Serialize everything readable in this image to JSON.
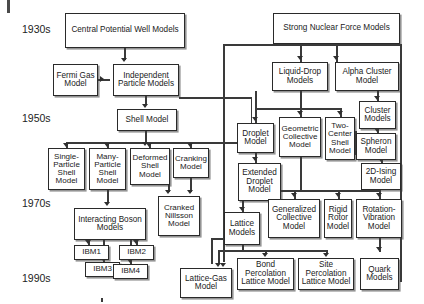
{
  "diagram": {
    "type": "flowchart",
    "eras": [
      {
        "id": "era-1930s",
        "label": "1930s",
        "x": 22,
        "y": 23,
        "size": 10.5
      },
      {
        "id": "era-1950s",
        "label": "1950s",
        "x": 22,
        "y": 112,
        "size": 10.5
      },
      {
        "id": "era-1970s",
        "label": "1970s",
        "x": 22,
        "y": 197,
        "size": 10.5
      },
      {
        "id": "era-1990s",
        "label": "1990s",
        "x": 22,
        "y": 272,
        "size": 10.5
      }
    ],
    "nodes": [
      {
        "id": "central-potential-well-models",
        "label": "Central Potential Well Models",
        "x": 65,
        "y": 13,
        "w": 120,
        "h": 35,
        "size": 8.2
      },
      {
        "id": "fermi-gas-model",
        "label": "Fermi Gas Model",
        "x": 53,
        "y": 64,
        "w": 45,
        "h": 32,
        "size": 8.2
      },
      {
        "id": "independent-particle-models",
        "label": "Independent Particle Models",
        "x": 113,
        "y": 64,
        "w": 66,
        "h": 32,
        "size": 8.2
      },
      {
        "id": "shell-model",
        "label": "Shell Model",
        "x": 117,
        "y": 109,
        "w": 60,
        "h": 22,
        "size": 8.2
      },
      {
        "id": "single-particle-shell-model",
        "label": "Single-Particle Shell Model",
        "x": 48,
        "y": 148,
        "w": 37,
        "h": 42,
        "size": 8.0
      },
      {
        "id": "many-particle-shell-model",
        "label": "Many-Particle Shell Model",
        "x": 89,
        "y": 148,
        "w": 37,
        "h": 42,
        "size": 8.0
      },
      {
        "id": "deformed-shell-model",
        "label": "Deformed Shell Model",
        "x": 130,
        "y": 148,
        "w": 40,
        "h": 37,
        "size": 8.0
      },
      {
        "id": "cranking-model",
        "label": "Cranking Model",
        "x": 173,
        "y": 148,
        "w": 36,
        "h": 30,
        "size": 8.0
      },
      {
        "id": "cranked-nillsson-model",
        "label": "Cranked Nillsson Model",
        "x": 158,
        "y": 196,
        "w": 42,
        "h": 40,
        "size": 8.0
      },
      {
        "id": "interacting-boson-models",
        "label": "Interacting Boson Models",
        "x": 74,
        "y": 208,
        "w": 72,
        "h": 32,
        "size": 8.2
      },
      {
        "id": "ibm1",
        "label": "IBM1",
        "x": 74,
        "y": 245,
        "w": 35,
        "h": 15,
        "size": 8.0
      },
      {
        "id": "ibm2",
        "label": "IBM2",
        "x": 119,
        "y": 245,
        "w": 35,
        "h": 15,
        "size": 8.0
      },
      {
        "id": "ibm3",
        "label": "IBM3",
        "x": 85,
        "y": 262,
        "w": 35,
        "h": 15,
        "size": 8.0
      },
      {
        "id": "ibm4",
        "label": "IBM4",
        "x": 113,
        "y": 264,
        "w": 35,
        "h": 15,
        "size": 8.0
      },
      {
        "id": "lattice-gas-model",
        "label": "Lattice-Gas Model",
        "x": 180,
        "y": 268,
        "w": 52,
        "h": 30,
        "size": 8.2
      },
      {
        "id": "strong-nuclear-force-models",
        "label": "Strong Nuclear Force Models",
        "x": 273,
        "y": 13,
        "w": 127,
        "h": 31,
        "size": 8.2
      },
      {
        "id": "liquid-drop-models",
        "label": "Liquid-Drop Models",
        "x": 272,
        "y": 62,
        "w": 56,
        "h": 29,
        "size": 8.2
      },
      {
        "id": "alpha-cluster-model",
        "label": "Alpha Cluster Model",
        "x": 335,
        "y": 62,
        "w": 64,
        "h": 29,
        "size": 8.2
      },
      {
        "id": "droplet-model",
        "label": "Droplet Model",
        "x": 237,
        "y": 123,
        "w": 37,
        "h": 30,
        "size": 8.2
      },
      {
        "id": "geometric-collective-model",
        "label": "Geometric Collective Model",
        "x": 279,
        "y": 117,
        "w": 42,
        "h": 40,
        "size": 8.0
      },
      {
        "id": "two-center-shell-model",
        "label": "Two-Center Shell Model",
        "x": 325,
        "y": 117,
        "w": 30,
        "h": 43,
        "size": 8.0
      },
      {
        "id": "cluster-models",
        "label": "Cluster Models",
        "x": 359,
        "y": 101,
        "w": 37,
        "h": 28,
        "size": 8.2
      },
      {
        "id": "spheron-model",
        "label": "Spheron Model",
        "x": 356,
        "y": 133,
        "w": 40,
        "h": 27,
        "size": 8.2
      },
      {
        "id": "2d-ising-model",
        "label": "2D-Ising Model",
        "x": 361,
        "y": 163,
        "w": 40,
        "h": 27,
        "size": 8.2
      },
      {
        "id": "extended-droplet-model",
        "label": "Extended Droplet Model",
        "x": 238,
        "y": 163,
        "w": 43,
        "h": 38,
        "size": 8.2
      },
      {
        "id": "lattice-models",
        "label": "Lattice Models",
        "x": 224,
        "y": 212,
        "w": 36,
        "h": 33,
        "size": 8.2
      },
      {
        "id": "generalized-collective-model",
        "label": "Generalized Collective Model",
        "x": 268,
        "y": 199,
        "w": 52,
        "h": 39,
        "size": 8.2
      },
      {
        "id": "rigid-rotor-model",
        "label": "Rigid Rotor Model",
        "x": 324,
        "y": 199,
        "w": 28,
        "h": 39,
        "size": 8.2
      },
      {
        "id": "rotation-vibration-model",
        "label": "Rotation-Vibration Model",
        "x": 356,
        "y": 199,
        "w": 46,
        "h": 39,
        "size": 8.2
      },
      {
        "id": "bond-percolation-lattice-model",
        "label": "Bond Percolation Lattice Model",
        "x": 237,
        "y": 258,
        "w": 57,
        "h": 32,
        "size": 8.2
      },
      {
        "id": "site-percolation-lattice-model",
        "label": "Site Percolation Lattice Model",
        "x": 298,
        "y": 258,
        "w": 56,
        "h": 32,
        "size": 8.2
      },
      {
        "id": "quark-models",
        "label": "Quark Models",
        "x": 360,
        "y": 258,
        "w": 39,
        "h": 32,
        "size": 8.2
      }
    ],
    "lines": [
      {
        "o": "v",
        "x": 124.4,
        "y": 48,
        "len": 12
      },
      {
        "o": "v",
        "x": 145.4,
        "y": 96,
        "len": 9
      },
      {
        "o": "h",
        "x": 98,
        "y": 79.4,
        "len": 12
      },
      {
        "o": "v",
        "x": 145.4,
        "y": 131,
        "len": 11
      },
      {
        "o": "h",
        "x": 66,
        "y": 142.4,
        "len": 186
      },
      {
        "o": "v",
        "x": 66.4,
        "y": 142,
        "len": 6
      },
      {
        "o": "v",
        "x": 107.4,
        "y": 142,
        "len": 6
      },
      {
        "o": "v",
        "x": 149.4,
        "y": 142,
        "len": 6
      },
      {
        "o": "v",
        "x": 190.4,
        "y": 142,
        "len": 6
      },
      {
        "o": "v",
        "x": 190.4,
        "y": 178,
        "len": 14
      },
      {
        "o": "v",
        "x": 168.4,
        "y": 185,
        "len": 7
      },
      {
        "o": "v",
        "x": 107.4,
        "y": 190,
        "len": 13
      },
      {
        "o": "v",
        "x": 88.4,
        "y": 240,
        "len": 5
      },
      {
        "o": "v",
        "x": 136.4,
        "y": 240,
        "len": 5
      },
      {
        "o": "v",
        "x": 103.4,
        "y": 240,
        "len": 22
      },
      {
        "o": "v",
        "x": 130.4,
        "y": 240,
        "len": 24
      },
      {
        "o": "v",
        "x": 251,
        "y": 97,
        "len": 46
      },
      {
        "o": "h",
        "x": 179,
        "y": 97.4,
        "len": 73
      },
      {
        "o": "v",
        "x": 336.4,
        "y": 44,
        "len": 18
      },
      {
        "o": "v",
        "x": 300.4,
        "y": 44,
        "len": 18
      },
      {
        "o": "h",
        "x": 223,
        "y": 44.4,
        "len": 178
      },
      {
        "o": "v",
        "x": 223.4,
        "y": 44,
        "len": 218
      },
      {
        "o": "v",
        "x": 400.4,
        "y": 44,
        "len": 238
      },
      {
        "o": "h",
        "x": 255,
        "y": 108.4,
        "len": 85
      },
      {
        "o": "v",
        "x": 255.4,
        "y": 91,
        "len": 18
      },
      {
        "o": "v",
        "x": 300.4,
        "y": 91,
        "len": 18
      },
      {
        "o": "v",
        "x": 255.4,
        "y": 108,
        "len": 15
      },
      {
        "o": "v",
        "x": 300.4,
        "y": 108,
        "len": 9
      },
      {
        "o": "v",
        "x": 340.4,
        "y": 108,
        "len": 9
      },
      {
        "o": "v",
        "x": 377.4,
        "y": 91,
        "len": 10
      },
      {
        "o": "v",
        "x": 377.4,
        "y": 129,
        "len": 4
      },
      {
        "o": "v",
        "x": 381.4,
        "y": 160,
        "len": 3
      },
      {
        "o": "v",
        "x": 355.4,
        "y": 131,
        "len": 24
      },
      {
        "o": "h",
        "x": 340,
        "y": 131.4,
        "len": 16
      },
      {
        "o": "v",
        "x": 255.4,
        "y": 153,
        "len": 10
      },
      {
        "o": "v",
        "x": 300.4,
        "y": 157,
        "len": 33
      },
      {
        "o": "h",
        "x": 255,
        "y": 190.4,
        "len": 125
      },
      {
        "o": "v",
        "x": 294.4,
        "y": 190,
        "len": 9
      },
      {
        "o": "v",
        "x": 338.4,
        "y": 190,
        "len": 9
      },
      {
        "o": "v",
        "x": 379.4,
        "y": 190,
        "len": 9
      },
      {
        "o": "v",
        "x": 379.4,
        "y": 238,
        "len": 14
      },
      {
        "o": "v",
        "x": 242.4,
        "y": 201,
        "len": 11
      },
      {
        "o": "h",
        "x": 218,
        "y": 250.4,
        "len": 110
      },
      {
        "o": "v",
        "x": 242.4,
        "y": 245,
        "len": 6
      },
      {
        "o": "v",
        "x": 218.4,
        "y": 250,
        "len": 14
      },
      {
        "o": "v",
        "x": 265.4,
        "y": 250,
        "len": 4
      },
      {
        "o": "v",
        "x": 326.4,
        "y": 250,
        "len": 4
      },
      {
        "o": "v",
        "x": 211.4,
        "y": 238,
        "len": 26
      },
      {
        "o": "h",
        "x": 211,
        "y": 238.4,
        "len": 13
      },
      {
        "o": "v",
        "x": 101.4,
        "y": 298,
        "len": 4
      }
    ],
    "arrows": [
      {
        "d": "down",
        "x": 121.2,
        "y": 58
      },
      {
        "d": "right",
        "x": 100,
        "y": 76.2
      },
      {
        "d": "down",
        "x": 142.2,
        "y": 104
      },
      {
        "d": "down",
        "x": 142.2,
        "y": 142
      },
      {
        "d": "down",
        "x": 63.2,
        "y": 143
      },
      {
        "d": "down",
        "x": 104.2,
        "y": 143
      },
      {
        "d": "down",
        "x": 146.2,
        "y": 143
      },
      {
        "d": "down",
        "x": 187.2,
        "y": 143
      },
      {
        "d": "down",
        "x": 187.2,
        "y": 190
      },
      {
        "d": "down",
        "x": 165.2,
        "y": 190
      },
      {
        "d": "down",
        "x": 104.2,
        "y": 202
      },
      {
        "d": "down",
        "x": 85.2,
        "y": 240
      },
      {
        "d": "down",
        "x": 133.2,
        "y": 240
      },
      {
        "d": "down",
        "x": 100.2,
        "y": 257
      },
      {
        "d": "down",
        "x": 127.2,
        "y": 259
      },
      {
        "d": "down",
        "x": 333.2,
        "y": 56
      },
      {
        "d": "down",
        "x": 297.2,
        "y": 56
      },
      {
        "d": "down",
        "x": 252.2,
        "y": 117
      },
      {
        "d": "down",
        "x": 297.2,
        "y": 111
      },
      {
        "d": "down",
        "x": 337.2,
        "y": 111
      },
      {
        "d": "down",
        "x": 374.2,
        "y": 96
      },
      {
        "d": "down",
        "x": 374.2,
        "y": 128
      },
      {
        "d": "down",
        "x": 378.2,
        "y": 158
      },
      {
        "d": "down",
        "x": 252.2,
        "y": 157
      },
      {
        "d": "down",
        "x": 291.2,
        "y": 193
      },
      {
        "d": "down",
        "x": 335.2,
        "y": 193
      },
      {
        "d": "down",
        "x": 376.2,
        "y": 193
      },
      {
        "d": "down",
        "x": 376.2,
        "y": 247
      },
      {
        "d": "down",
        "x": 239.2,
        "y": 207
      },
      {
        "d": "down",
        "x": 262.2,
        "y": 253
      },
      {
        "d": "down",
        "x": 323.2,
        "y": 253
      },
      {
        "d": "down",
        "x": 215.2,
        "y": 263
      },
      {
        "d": "down",
        "x": 220.2,
        "y": 263
      }
    ],
    "artifacts": [
      {
        "id": "edge-mark",
        "x": 7,
        "y": 0,
        "w": 3,
        "h": 13
      }
    ]
  }
}
